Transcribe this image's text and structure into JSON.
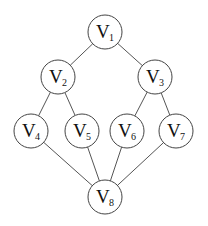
{
  "diagram": {
    "type": "graph",
    "nodes": [
      {
        "id": "v1",
        "letter": "V",
        "sub": "1",
        "x": 105,
        "y": 32
      },
      {
        "id": "v2",
        "letter": "V",
        "sub": "2",
        "x": 58,
        "y": 77
      },
      {
        "id": "v3",
        "letter": "V",
        "sub": "3",
        "x": 155,
        "y": 77
      },
      {
        "id": "v4",
        "letter": "V",
        "sub": "4",
        "x": 31,
        "y": 131
      },
      {
        "id": "v5",
        "letter": "V",
        "sub": "5",
        "x": 82,
        "y": 131
      },
      {
        "id": "v6",
        "letter": "V",
        "sub": "6",
        "x": 127,
        "y": 131
      },
      {
        "id": "v7",
        "letter": "V",
        "sub": "7",
        "x": 176,
        "y": 131
      },
      {
        "id": "v8",
        "letter": "V",
        "sub": "8",
        "x": 105,
        "y": 197
      }
    ],
    "edges": [
      [
        "v1",
        "v2"
      ],
      [
        "v1",
        "v3"
      ],
      [
        "v2",
        "v4"
      ],
      [
        "v2",
        "v5"
      ],
      [
        "v3",
        "v6"
      ],
      [
        "v3",
        "v7"
      ],
      [
        "v4",
        "v8"
      ],
      [
        "v5",
        "v8"
      ],
      [
        "v6",
        "v8"
      ],
      [
        "v7",
        "v8"
      ]
    ],
    "node_radius": 17
  }
}
